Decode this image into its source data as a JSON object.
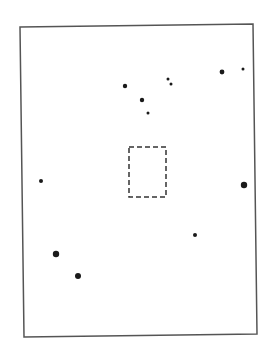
{
  "figure": {
    "width": 274,
    "height": 351,
    "background": "#ffffff",
    "frame": {
      "points": [
        [
          20,
          27
        ],
        [
          253,
          24
        ],
        [
          257,
          334
        ],
        [
          24,
          337
        ]
      ],
      "stroke": "#555555",
      "stroke_width": 1.5
    },
    "dashed_box": {
      "x": 129,
      "y": 147,
      "width": 37,
      "height": 50,
      "stroke": "#333333",
      "dash": "5,3"
    },
    "dots": [
      {
        "x": 125,
        "y": 86,
        "r": 2.2
      },
      {
        "x": 142,
        "y": 100,
        "r": 2.2
      },
      {
        "x": 148,
        "y": 113,
        "r": 1.5
      },
      {
        "x": 168,
        "y": 79,
        "r": 1.5
      },
      {
        "x": 171,
        "y": 84,
        "r": 1.5
      },
      {
        "x": 222,
        "y": 72,
        "r": 2.4
      },
      {
        "x": 243,
        "y": 69,
        "r": 1.5
      },
      {
        "x": 41,
        "y": 181,
        "r": 2.0
      },
      {
        "x": 244,
        "y": 185,
        "r": 3.2
      },
      {
        "x": 195,
        "y": 235,
        "r": 2.0
      },
      {
        "x": 56,
        "y": 254,
        "r": 3.2
      },
      {
        "x": 78,
        "y": 276,
        "r": 3.0
      }
    ],
    "dot_color": "#1a1a1a"
  }
}
